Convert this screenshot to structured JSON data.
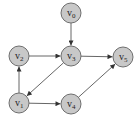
{
  "diagram": {
    "type": "directed-graph",
    "colors": {
      "node_fill": "#c8c8c8",
      "node_stroke": "#6e6e6e",
      "edge": "#555555",
      "text": "#222222"
    },
    "nodes": [
      {
        "id": "v0",
        "label": "v",
        "sub": "0",
        "x": 71,
        "y": 13
      },
      {
        "id": "v1",
        "label": "v",
        "sub": "1",
        "x": 19,
        "y": 103
      },
      {
        "id": "v2",
        "label": "v",
        "sub": "2",
        "x": 19,
        "y": 56
      },
      {
        "id": "v3",
        "label": "v",
        "sub": "3",
        "x": 71,
        "y": 56
      },
      {
        "id": "v4",
        "label": "v",
        "sub": "4",
        "x": 71,
        "y": 104
      },
      {
        "id": "v5",
        "label": "v",
        "sub": "5",
        "x": 123,
        "y": 57
      }
    ],
    "edges": [
      {
        "from": "v0",
        "to": "v3"
      },
      {
        "from": "v2",
        "to": "v3"
      },
      {
        "from": "v3",
        "to": "v5"
      },
      {
        "from": "v3",
        "to": "v1"
      },
      {
        "from": "v1",
        "to": "v2"
      },
      {
        "from": "v1",
        "to": "v4"
      },
      {
        "from": "v4",
        "to": "v5"
      }
    ]
  }
}
